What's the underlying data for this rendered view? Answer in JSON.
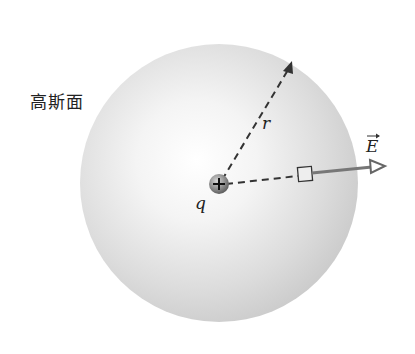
{
  "diagram": {
    "surface_label": "高斯面",
    "radius_label": "r",
    "charge_label": "q",
    "charge_sign": "+",
    "field_label": "E",
    "colors": {
      "sphere_center": "#ffffff",
      "sphere_edge": "#c9c9c9",
      "arrow": "#6f6f6f",
      "dash": "#333333",
      "charge": "#7a7a7a"
    }
  }
}
